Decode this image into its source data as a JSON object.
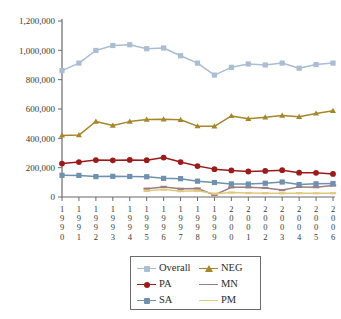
{
  "chart_data": {
    "type": "line",
    "title": "",
    "subtitle": "",
    "xlabel": "",
    "ylabel": "",
    "ylim": [
      0,
      1200000
    ],
    "ytick_labels": [
      "0",
      "200,000",
      "400,000",
      "600,000",
      "800,000",
      "1,000,000",
      "1,200,000"
    ],
    "ytick_values": [
      0,
      200000,
      400000,
      600000,
      800000,
      1000000,
      1200000
    ],
    "grid": false,
    "legend_position": "bottom",
    "x": [
      1990,
      1991,
      1992,
      1993,
      1994,
      1995,
      1996,
      1997,
      1998,
      1999,
      2000,
      2001,
      2002,
      2003,
      2004,
      2005,
      2006
    ],
    "categories": [
      "1990",
      "1991",
      "1992",
      "1993",
      "1994",
      "1995",
      "1996",
      "1997",
      "1998",
      "1999",
      "2000",
      "2001",
      "2002",
      "2003",
      "2004",
      "2005",
      "2006"
    ],
    "series": [
      {
        "name": "Overall",
        "color": "#aabdd1",
        "marker": "square",
        "values": [
          862000,
          913000,
          999000,
          1033000,
          1038000,
          1011000,
          1016000,
          963000,
          913000,
          831000,
          884000,
          907000,
          900000,
          913000,
          878000,
          903000,
          913000
        ]
      },
      {
        "name": "NEG",
        "color": "#a5862a",
        "marker": "triangle",
        "values": [
          420000,
          422000,
          515000,
          488000,
          514000,
          528000,
          530000,
          527000,
          483000,
          482000,
          553000,
          533000,
          544000,
          556000,
          547000,
          570000,
          588000
        ]
      },
      {
        "name": "PA",
        "color": "#9b1b1b",
        "marker": "circle",
        "values": [
          228000,
          238000,
          252000,
          250000,
          253000,
          251000,
          269000,
          238000,
          211000,
          190000,
          181000,
          174000,
          178000,
          183000,
          166000,
          165000,
          157000
        ]
      },
      {
        "name": "MN",
        "color": "#9c7d84",
        "marker": "dash",
        "values": [
          null,
          null,
          null,
          null,
          null,
          57000,
          69000,
          56000,
          58000,
          14000,
          66000,
          66000,
          62000,
          47000,
          69000,
          67000,
          78000
        ]
      },
      {
        "name": "SA",
        "color": "#6f91ad",
        "marker": "square",
        "values": [
          148000,
          147000,
          139000,
          141000,
          140000,
          138000,
          127000,
          125000,
          108000,
          99000,
          89000,
          88000,
          94000,
          102000,
          85000,
          90000,
          92000
        ]
      },
      {
        "name": "PM",
        "color": "#e2c87e",
        "marker": "dash",
        "values": [
          null,
          null,
          null,
          null,
          null,
          42000,
          51000,
          40000,
          43000,
          23000,
          30000,
          27000,
          26000,
          25000,
          26000,
          25000,
          26000
        ]
      }
    ]
  },
  "legend": {
    "entries": [
      {
        "label": "Overall",
        "series": "Overall"
      },
      {
        "label": "NEG",
        "series": "NEG"
      },
      {
        "label": "PA",
        "series": "PA"
      },
      {
        "label": "MN",
        "series": "MN"
      },
      {
        "label": "SA",
        "series": "SA"
      },
      {
        "label": "PM",
        "series": "PM"
      }
    ]
  },
  "axes": {
    "axis_color": "#6b6b6b",
    "tick_color": "#6b6b6b"
  }
}
